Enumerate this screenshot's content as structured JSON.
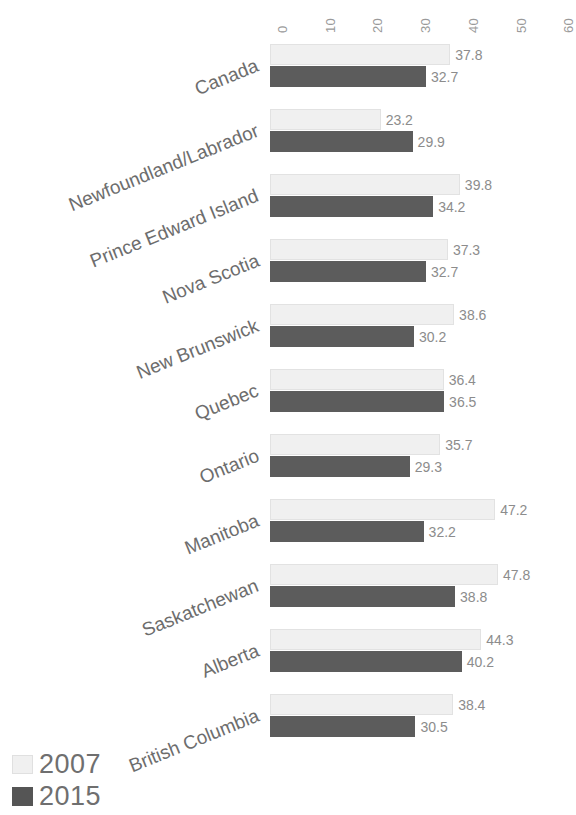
{
  "chart_data": {
    "type": "bar",
    "orientation": "horizontal",
    "title": "",
    "subtitle": "",
    "xlabel": "",
    "ylabel": "",
    "xlim": [
      0,
      60
    ],
    "xticks": [
      0,
      10,
      20,
      30,
      40,
      50,
      60
    ],
    "xtick_labels": [
      "0",
      "10",
      "20",
      "30",
      "40",
      "50",
      "60"
    ],
    "grid": false,
    "legend_position": "bottom-left",
    "categories": [
      "Canada",
      "Newfoundland/Labrador",
      "Prince Edward Island",
      "Nova Scotia",
      "New Brunswick",
      "Quebec",
      "Ontario",
      "Manitoba",
      "Saskatchewan",
      "Alberta",
      "British Columbia"
    ],
    "series": [
      {
        "name": "2007",
        "color": "#f0f0f0",
        "values": [
          37.8,
          23.2,
          39.8,
          37.3,
          38.6,
          36.4,
          35.7,
          47.2,
          47.8,
          44.3,
          38.4
        ],
        "labels": [
          "37.8",
          "23.2",
          "39.8",
          "37.3",
          "38.6",
          "36.4",
          "35.7",
          "47.2",
          "47.8",
          "44.3",
          "38.4"
        ]
      },
      {
        "name": "2015",
        "color": "#5c5c5c",
        "values": [
          32.7,
          29.9,
          34.2,
          32.7,
          30.2,
          36.5,
          29.3,
          32.2,
          38.8,
          40.2,
          30.5
        ],
        "labels": [
          "32.7",
          "29.9",
          "34.2",
          "32.7",
          "30.2",
          "36.5",
          "29.3",
          "32.2",
          "38.8",
          "40.2",
          "30.5"
        ]
      }
    ]
  },
  "legend": {
    "items": [
      {
        "label": "2007",
        "color": "#f0f0f0"
      },
      {
        "label": "2015",
        "color": "#5c5c5c"
      }
    ]
  }
}
